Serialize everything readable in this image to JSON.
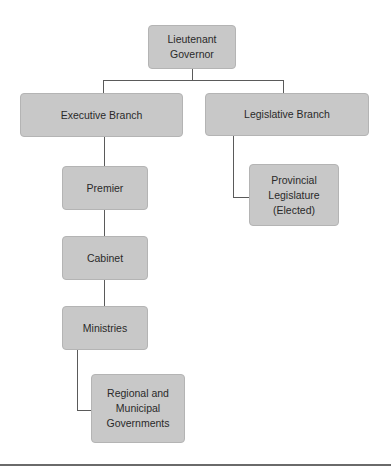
{
  "diagram": {
    "type": "org-chart",
    "nodes": {
      "lieutenant_governor": {
        "label": "Lieutenant\nGovernor"
      },
      "executive_branch": {
        "label": "Executive Branch"
      },
      "legislative_branch": {
        "label": "Legislative Branch"
      },
      "provincial_legislature": {
        "label": "Provincial\nLegislature\n(Elected)"
      },
      "premier": {
        "label": "Premier"
      },
      "cabinet": {
        "label": "Cabinet"
      },
      "ministries": {
        "label": "Ministries"
      },
      "regional_municipal": {
        "label": "Regional and\nMunicipal\nGovernments"
      }
    },
    "edges": [
      [
        "Lieutenant Governor",
        "Executive Branch"
      ],
      [
        "Lieutenant Governor",
        "Legislative Branch"
      ],
      [
        "Legislative Branch",
        "Provincial Legislature (Elected)"
      ],
      [
        "Executive Branch",
        "Premier"
      ],
      [
        "Premier",
        "Cabinet"
      ],
      [
        "Cabinet",
        "Ministries"
      ],
      [
        "Ministries",
        "Regional and Municipal Governments"
      ]
    ],
    "colors": {
      "node_fill": "#c8c8c8",
      "node_border": "#b4b4b4",
      "connector": "#5a5a5a",
      "text": "#2a2a2a"
    }
  }
}
